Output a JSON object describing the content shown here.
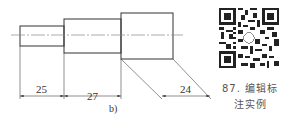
{
  "drawing": {
    "label": "b)",
    "dimensions": [
      "25",
      "27",
      "24"
    ],
    "colors": {
      "line": "#333333",
      "centerline": "#888888"
    }
  },
  "qr": {
    "icon": "qr-code-icon"
  },
  "caption": {
    "line1": "87. 编辑标",
    "line2": "注实例"
  }
}
